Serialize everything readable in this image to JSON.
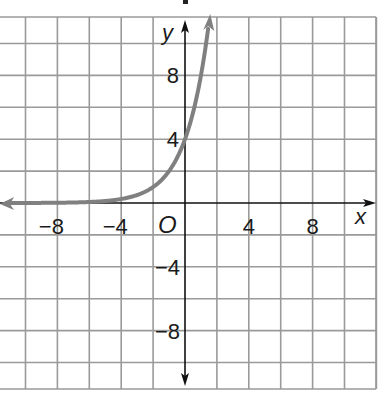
{
  "chart_data": {
    "type": "line",
    "title": "",
    "xlabel": "x",
    "ylabel": "y",
    "origin_label": "O",
    "xlim": [
      -11.6,
      12
    ],
    "ylim": [
      -11.6,
      11.6
    ],
    "grid": true,
    "grid_step": 2,
    "x_ticks": [
      -8,
      -4,
      4,
      8
    ],
    "y_ticks": [
      8,
      4,
      -4,
      -8
    ],
    "x_tick_labels": [
      "−8",
      "−4",
      "4",
      "8"
    ],
    "y_tick_labels": [
      "8",
      "4",
      "−4",
      "−8"
    ],
    "series": [
      {
        "name": "y = 4·2^x",
        "color": "#808080",
        "x": [
          -11.6,
          -8,
          -6,
          -4,
          -3,
          -2,
          -1,
          0,
          0.5,
          1,
          1.3,
          1.5
        ],
        "y": [
          0.001,
          0.016,
          0.0625,
          0.25,
          0.5,
          1,
          2,
          4,
          5.66,
          8,
          9.85,
          11.3
        ],
        "y_intercept": 4,
        "asymptote": "y = 0"
      }
    ]
  },
  "colors": {
    "grid": "#9a9a9a",
    "axis": "#111111",
    "curve": "#808080"
  }
}
